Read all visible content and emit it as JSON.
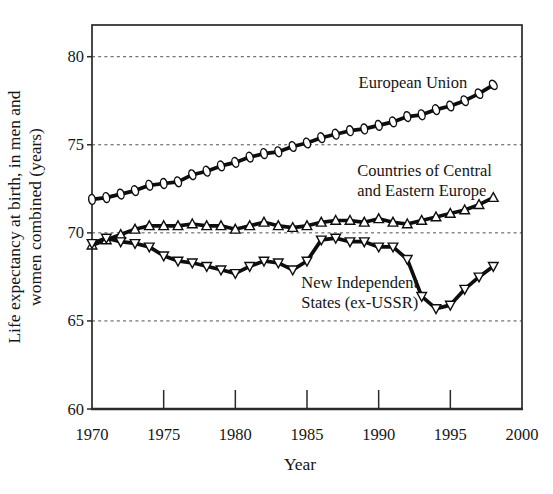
{
  "figure": {
    "background": "#ffffff",
    "ink": "#0e0e0e",
    "grid_color": "#4f4f4f",
    "marker_fill": "#ffffff"
  },
  "chart_data": {
    "type": "line",
    "title": "",
    "xlabel": "Year",
    "ylabel_lines": [
      "Life expectancy at birth, in men and",
      "women combined (years)"
    ],
    "xlim": [
      1970,
      2000
    ],
    "ylim": [
      60,
      81.8
    ],
    "x_ticks": [
      1970,
      1975,
      1980,
      1985,
      1990,
      1995,
      2000
    ],
    "y_ticks": [
      60,
      65,
      70,
      75,
      80
    ],
    "grid": "horizontal dashed lines at 65, 70, 75, 80",
    "legend_position": "inline annotations near each line",
    "x": [
      1970,
      1971,
      1972,
      1973,
      1974,
      1975,
      1976,
      1977,
      1978,
      1979,
      1980,
      1981,
      1982,
      1983,
      1984,
      1985,
      1986,
      1987,
      1988,
      1989,
      1990,
      1991,
      1992,
      1993,
      1994,
      1995,
      1996,
      1997,
      1998
    ],
    "series": [
      {
        "name": "European Union",
        "marker": "ellipse",
        "values": [
          71.9,
          72.0,
          72.2,
          72.4,
          72.7,
          72.8,
          72.9,
          73.3,
          73.5,
          73.8,
          74.0,
          74.3,
          74.5,
          74.6,
          74.9,
          75.1,
          75.4,
          75.6,
          75.8,
          75.9,
          76.1,
          76.3,
          76.6,
          76.7,
          77.0,
          77.2,
          77.5,
          77.9,
          78.4
        ],
        "label": {
          "lines": [
            "European Union"
          ],
          "x": 1988.6,
          "y": 78.25
        }
      },
      {
        "name": "Countries of Central and Eastern Europe",
        "marker": "triangle-up",
        "values": [
          69.3,
          69.6,
          69.9,
          70.2,
          70.4,
          70.4,
          70.4,
          70.5,
          70.4,
          70.4,
          70.2,
          70.4,
          70.6,
          70.4,
          70.3,
          70.4,
          70.6,
          70.7,
          70.7,
          70.6,
          70.8,
          70.6,
          70.5,
          70.7,
          70.9,
          71.1,
          71.3,
          71.6,
          72.0
        ],
        "label": {
          "lines": [
            "Countries of Central",
            "and Eastern Europe"
          ],
          "x": 1988.5,
          "y": 73.2
        }
      },
      {
        "name": "New Independent States (ex-USSR)",
        "marker": "triangle-down",
        "values": [
          69.4,
          69.7,
          69.5,
          69.4,
          69.2,
          68.7,
          68.4,
          68.3,
          68.1,
          67.9,
          67.7,
          68.1,
          68.4,
          68.3,
          67.9,
          68.4,
          69.6,
          69.7,
          69.5,
          69.5,
          69.2,
          69.2,
          68.5,
          66.4,
          65.7,
          65.9,
          66.8,
          67.5,
          68.1
        ],
        "label": {
          "lines": [
            "New Independent",
            "States (ex-USSR)"
          ],
          "x": 1984.6,
          "y": 66.85
        }
      }
    ]
  }
}
